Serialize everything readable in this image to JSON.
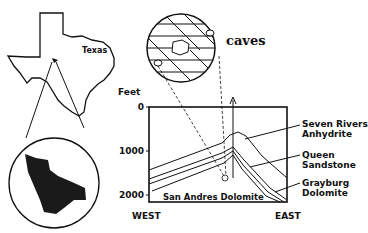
{
  "map": {
    "state_label": "Texas"
  },
  "zoom_circle": {
    "label": "caves"
  },
  "cross_section": {
    "axis_title": "Feet",
    "y_ticks": [
      "0",
      "1000",
      "2000"
    ],
    "west_label": "WEST",
    "east_label": "EAST",
    "base_layer_label": "San Andres Dolomite",
    "layers": [
      {
        "line1": "Seven Rivers",
        "line2": "Anhydrite"
      },
      {
        "line1": "Queen",
        "line2": "Sandstone"
      },
      {
        "line1": "Grayburg",
        "line2": "Dolomite"
      }
    ]
  }
}
